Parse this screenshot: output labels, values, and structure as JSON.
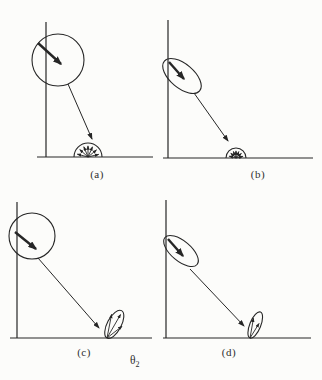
{
  "figure": {
    "background": "#fcfcfa",
    "ink_color": "#262626",
    "label_color": "#2e2e2e",
    "caption": {
      "symbol": "θ",
      "subscript": "2"
    },
    "panels": [
      {
        "id": "a",
        "label": "(a)",
        "top_shape": "circle",
        "bottom_shape": "fan-semicircle",
        "bottom_size": "large"
      },
      {
        "id": "b",
        "label": "(b)",
        "top_shape": "ellipse",
        "bottom_shape": "fan-semicircle",
        "bottom_size": "small"
      },
      {
        "id": "c",
        "label": "(c)",
        "top_shape": "circle",
        "bottom_shape": "lobe",
        "bottom_size": "large"
      },
      {
        "id": "d",
        "label": "(d)",
        "top_shape": "ellipse",
        "bottom_shape": "lobe",
        "bottom_size": "small"
      }
    ]
  }
}
